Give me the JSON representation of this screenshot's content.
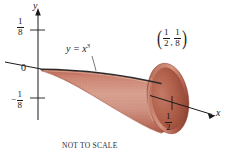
{
  "figure": {
    "caption": "NOT TO SCALE",
    "axes": {
      "y_label": "y",
      "x_label": "x",
      "origin_label": "0",
      "y_tick_positive": {
        "numerator": "1",
        "denominator": "8"
      },
      "y_tick_negative": {
        "minus": "−",
        "numerator": "1",
        "denominator": "8"
      },
      "x_tick": {
        "numerator": "1",
        "denominator": "2"
      }
    },
    "curve": {
      "label_lhs": "y = x",
      "label_exponent": "3"
    },
    "point": {
      "open_paren": "(",
      "x": {
        "numerator": "1",
        "denominator": "2"
      },
      "comma": ",",
      "y": {
        "numerator": "1",
        "denominator": "8"
      },
      "close_paren": ")"
    },
    "colors": {
      "surface_light": "#d9a394",
      "surface_mid": "#c4796a",
      "surface_dark": "#a85542",
      "rim_interior": "#b4604c",
      "curve_line": "#2e2b2b",
      "axis_line": "#1a1a1a",
      "background": "#ffffff"
    }
  }
}
